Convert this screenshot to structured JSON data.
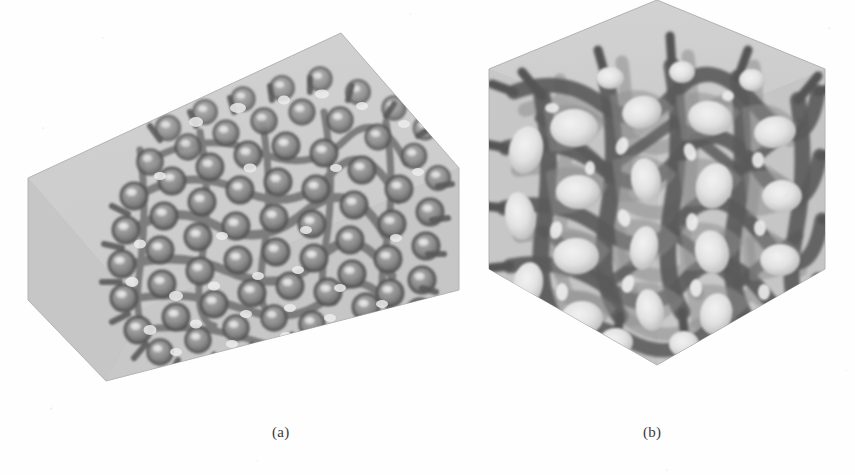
{
  "figure": {
    "kind": "scanned-scientific-figure",
    "background_color": "#fefefe",
    "panels": [
      {
        "id": "a",
        "caption": "(a)",
        "subject": "open-cell foam microstructure, fine cell size",
        "container_shape": "elongated rectangular box, isometric view",
        "container_fill_color": "#c8c8c8",
        "container_top_face_color": "#cfcfcf",
        "container_front_face_color": "#c2c2c2",
        "container_side_face_color": "#b9b9b9",
        "strut_dark_color": "#5c5c5c",
        "strut_mid_color": "#8a8a8a",
        "cell_highlight_color": "#e8e8e8",
        "cell_count_estimate": 120,
        "relative_cell_size": "small"
      },
      {
        "id": "b",
        "caption": "(b)",
        "subject": "open-cell foam microstructure, coarse cell size",
        "container_shape": "cube, isometric view",
        "container_fill_color": "#c8c8c8",
        "container_top_face_color": "#cfcfcf",
        "container_front_face_color": "#c2c2c2",
        "container_side_face_color": "#b9b9b9",
        "strut_dark_color": "#585858",
        "strut_mid_color": "#878787",
        "cell_highlight_color": "#ebebeb",
        "cell_count_estimate": 40,
        "relative_cell_size": "large"
      }
    ]
  },
  "geometry": {
    "panel_a_box": {
      "left_vertex": [
        27,
        178
      ],
      "left_bottom_vertex": [
        27,
        300
      ],
      "bottom_vertex": [
        106,
        381
      ],
      "right_bottom_vertex": [
        459,
        290
      ],
      "right_vertex": [
        459,
        168
      ],
      "apex_vertex": [
        341,
        33
      ],
      "top_left_vertex": [
        28,
        178
      ]
    },
    "panel_b_box": {
      "left_vertex": [
        489,
        100
      ],
      "left_bottom_vertex": [
        489,
        300
      ],
      "bottom_vertex": [
        657,
        396
      ],
      "right_bottom_vertex": [
        825,
        300
      ],
      "right_vertex": [
        825,
        100
      ],
      "apex_vertex": [
        657,
        31
      ]
    }
  },
  "captions": {
    "a": "(a)",
    "b": "(b)"
  }
}
